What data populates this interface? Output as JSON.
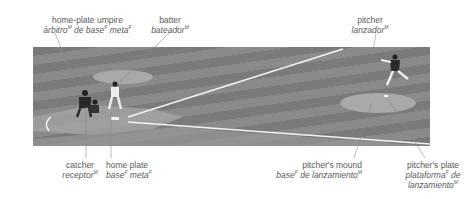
{
  "labels": {
    "umpire": {
      "en": "home-plate umpire",
      "es_1": "árbitro",
      "sup_1": "M",
      "es_2": " de base",
      "sup_2": "F",
      "es_3": " meta",
      "sup_3": "F"
    },
    "batter": {
      "en": "batter",
      "es_1": "bateador",
      "sup_1": "M"
    },
    "pitcher": {
      "en": "pitcher",
      "es_1": "lanzador",
      "sup_1": "M"
    },
    "catcher": {
      "en": "catcher",
      "es_1": "receptor",
      "sup_1": "M"
    },
    "home_plate": {
      "en": "home plate",
      "es_1": "base",
      "sup_1": "F",
      "es_2": " meta",
      "sup_2": "F"
    },
    "mound": {
      "en": "pitcher's mound",
      "es_1": "base",
      "sup_1": "F",
      "es_2": " de lanzamiento",
      "sup_2": "M"
    },
    "plate": {
      "en": "pitcher's plate",
      "es_1": "plataforma",
      "sup_1": "F",
      "es_2": " de",
      "es_3": "lanzamiento",
      "sup_3": "M"
    }
  }
}
